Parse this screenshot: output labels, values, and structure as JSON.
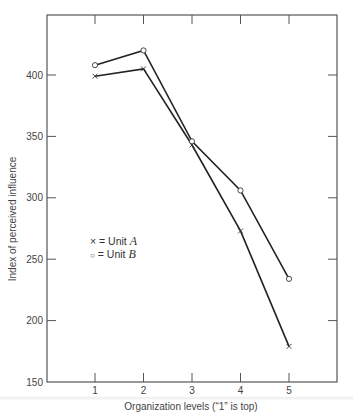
{
  "chart_data": {
    "type": "line",
    "title": "",
    "xlabel": "Organization  levels (“1” is top)",
    "ylabel": "Index of perceived influence",
    "categories": [
      "1",
      "2",
      "3",
      "4",
      "5"
    ],
    "x": [
      1,
      2,
      3,
      4,
      5
    ],
    "xlim": [
      0,
      6
    ],
    "ylim": [
      150,
      440
    ],
    "yticks": [
      150,
      200,
      250,
      300,
      350,
      400
    ],
    "grid": false,
    "legend_position": "inside-left-middle",
    "series": [
      {
        "name": "Unit A",
        "marker": "x",
        "values": [
          399,
          405,
          343,
          273,
          179
        ]
      },
      {
        "name": "Unit B",
        "marker": "o",
        "values": [
          408,
          420,
          346,
          306,
          234
        ]
      }
    ],
    "legend": [
      {
        "marker_symbol": "×",
        "eq": " = Unit ",
        "letter": "A"
      },
      {
        "marker_symbol": "○",
        "eq": " = Unit ",
        "letter": "B"
      }
    ],
    "colors": {
      "line": "#222222",
      "axis": "#555555",
      "text": "#444444"
    }
  }
}
